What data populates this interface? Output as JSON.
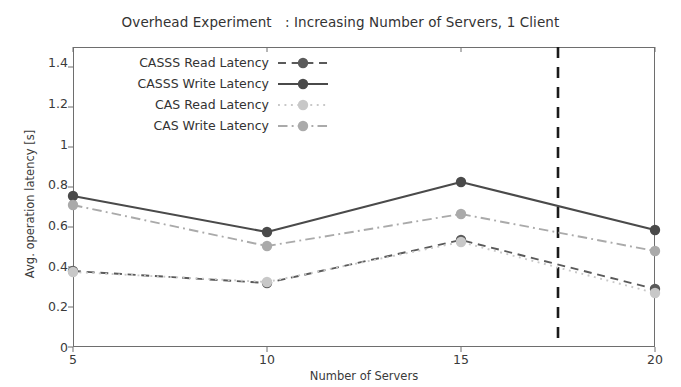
{
  "chart_data": {
    "type": "line",
    "title": "Overhead Experiment   : Increasing Number of Servers, 1 Client",
    "xlabel": "Number of Servers",
    "ylabel": "Avg. operation latency [s]",
    "x": [
      5,
      10,
      15,
      20
    ],
    "xlim": [
      5,
      20
    ],
    "ylim": [
      0,
      1.5
    ],
    "xticks": [
      "5",
      "10",
      "15",
      "20"
    ],
    "yticks": [
      "0",
      "0.2",
      "0.4",
      "0.6",
      "0.8",
      "1",
      "1.2",
      "1.4"
    ],
    "ytick_values": [
      0,
      0.2,
      0.4,
      0.6,
      0.8,
      1.0,
      1.2,
      1.4
    ],
    "grid": false,
    "legend_position": "upper left",
    "series": [
      {
        "name": "CASSS Read Latency",
        "values": [
          0.38,
          0.32,
          0.535,
          0.29
        ],
        "color": "#5a5a5a",
        "style": "dashed",
        "marker": "circle"
      },
      {
        "name": "CASSS Write Latency",
        "values": [
          0.755,
          0.575,
          0.825,
          0.585
        ],
        "color": "#4a4a4a",
        "style": "solid",
        "marker": "circle"
      },
      {
        "name": "CAS Read Latency",
        "values": [
          0.375,
          0.325,
          0.525,
          0.27
        ],
        "color": "#c8c8c8",
        "style": "dotted",
        "marker": "circle"
      },
      {
        "name": "CAS Write Latency",
        "values": [
          0.71,
          0.505,
          0.665,
          0.48
        ],
        "color": "#aaaaaa",
        "style": "dashdot",
        "marker": "circle"
      }
    ],
    "annotations": [
      {
        "name": "vertical-threshold-line",
        "type": "vline",
        "x": 17.5,
        "color": "#1a1a1a",
        "style": "dashed"
      }
    ]
  }
}
